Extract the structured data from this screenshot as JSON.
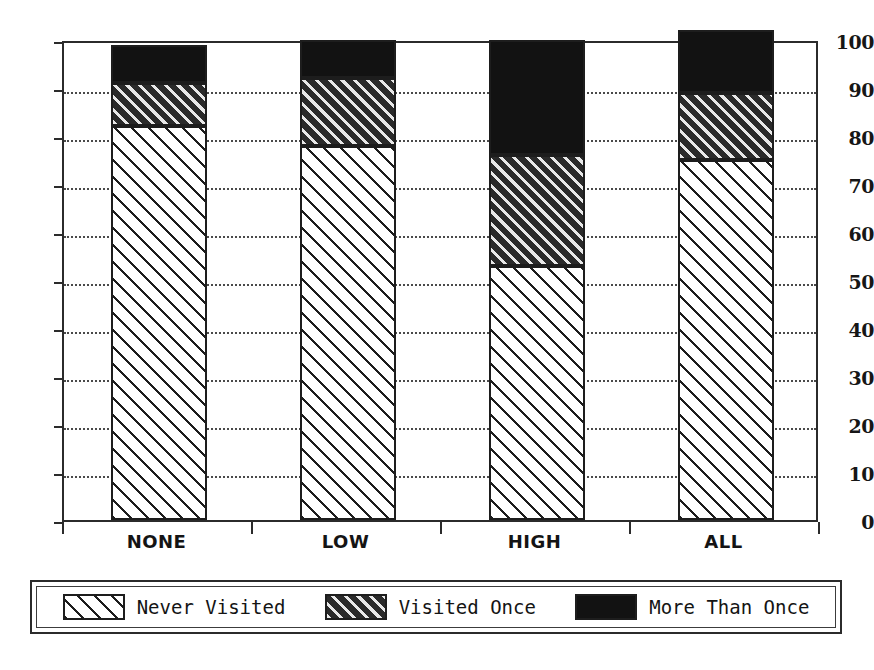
{
  "chart_data": {
    "type": "bar",
    "subtype": "stacked-bar",
    "title": "",
    "xlabel": "",
    "ylabel": "",
    "categories": [
      "NONE",
      "LOW",
      "HIGH",
      "ALL"
    ],
    "series": [
      {
        "name": "Never Visited",
        "values": [
          82,
          78,
          53,
          75
        ],
        "fill": "sparse-diagonal-hatch"
      },
      {
        "name": "Visited Once",
        "values": [
          9,
          14,
          23,
          14
        ],
        "fill": "dense-diagonal-hatch"
      },
      {
        "name": "More Than Once",
        "values": [
          8,
          8,
          24,
          13
        ],
        "fill": "solid-black"
      }
    ],
    "cumulative_tops": [
      [
        82,
        91,
        99
      ],
      [
        78,
        92,
        100
      ],
      [
        53,
        76,
        100
      ],
      [
        75,
        89,
        102
      ]
    ],
    "ylim": [
      0,
      100
    ],
    "ytick_labels": [
      "0",
      "10",
      "20",
      "30",
      "40",
      "50",
      "60",
      "70",
      "80",
      "90",
      "100"
    ],
    "ytick_values": [
      0,
      10,
      20,
      30,
      40,
      50,
      60,
      70,
      80,
      90,
      100
    ],
    "grid": "horizontal-dotted",
    "legend_position": "below-plot",
    "colors": {
      "axis": "#2b2b2b",
      "grid": "#4a4a4a",
      "solid_fill": "#121212",
      "dense_hatch_ground": "#2a2a2a",
      "sparse_hatch_ground": "#ffffff",
      "background": "#ffffff"
    }
  },
  "axis": {
    "y_ticks": [
      {
        "label": "100",
        "value": 100
      },
      {
        "label": "90",
        "value": 90
      },
      {
        "label": "80",
        "value": 80
      },
      {
        "label": "70",
        "value": 70
      },
      {
        "label": "60",
        "value": 60
      },
      {
        "label": "50",
        "value": 50
      },
      {
        "label": "40",
        "value": 40
      },
      {
        "label": "30",
        "value": 30
      },
      {
        "label": "20",
        "value": 20
      },
      {
        "label": "10",
        "value": 10
      },
      {
        "label": "0",
        "value": 0
      }
    ],
    "x_ticks": [
      {
        "label": "NONE"
      },
      {
        "label": "LOW"
      },
      {
        "label": "HIGH"
      },
      {
        "label": "ALL"
      }
    ]
  },
  "legend": {
    "items": [
      {
        "label": "Never Visited",
        "pattern": "sparse-diagonal-hatch"
      },
      {
        "label": "Visited Once",
        "pattern": "dense-diagonal-hatch"
      },
      {
        "label": "More Than Once",
        "pattern": "solid-black"
      }
    ]
  }
}
